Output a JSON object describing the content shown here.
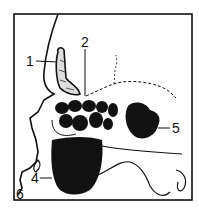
{
  "diagram": {
    "labels": [
      {
        "id": "1",
        "text": "1",
        "x": 30,
        "y": 66
      },
      {
        "id": "2",
        "text": "2",
        "x": 81,
        "y": 46
      },
      {
        "id": "4",
        "text": "4",
        "x": 33,
        "y": 183
      },
      {
        "id": "5",
        "text": "5",
        "x": 173,
        "y": 133
      },
      {
        "id": "6",
        "text": "6",
        "x": 16,
        "y": 198
      }
    ],
    "colors": {
      "ink": "#111111",
      "background": "#ffffff"
    }
  }
}
